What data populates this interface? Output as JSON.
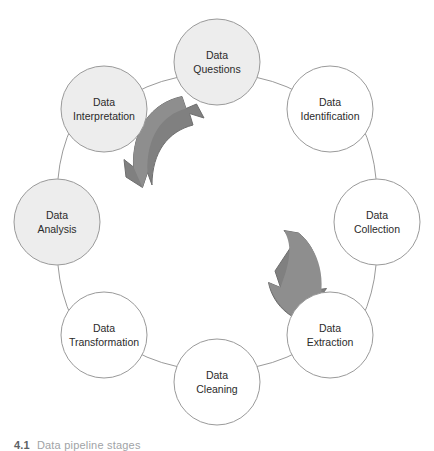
{
  "figure": {
    "type": "cycle-diagram",
    "geometry": {
      "center_x": 217,
      "center_y": 222,
      "ring_radius": 160,
      "node_radius": 43
    },
    "colors": {
      "node_fill_shaded": "#ededed",
      "node_fill_plain": "#ffffff",
      "node_stroke": "#9a9a9a",
      "arrow_fill": "#808080",
      "arrow_stroke": "#6e6e6e",
      "label_text": "#2b2b2b",
      "background": "#ffffff"
    },
    "nodes": [
      {
        "id": "data-questions",
        "line1": "Data",
        "line2": "Questions",
        "angle_deg": -90,
        "shaded": true,
        "cx": 217,
        "cy": 62
      },
      {
        "id": "data-identification",
        "line1": "Data",
        "line2": "Identification",
        "angle_deg": -45,
        "shaded": false,
        "cx": 330,
        "cy": 109
      },
      {
        "id": "data-collection",
        "line1": "Data",
        "line2": "Collection",
        "angle_deg": 0,
        "shaded": false,
        "cx": 377,
        "cy": 222
      },
      {
        "id": "data-extraction",
        "line1": "Data",
        "line2": "Extraction",
        "angle_deg": 45,
        "shaded": false,
        "cx": 330,
        "cy": 335
      },
      {
        "id": "data-cleaning",
        "line1": "Data",
        "line2": "Cleaning",
        "angle_deg": 90,
        "shaded": false,
        "cx": 217,
        "cy": 382
      },
      {
        "id": "data-transformation",
        "line1": "Data",
        "line2": "Transformation",
        "angle_deg": 135,
        "shaded": false,
        "cx": 104,
        "cy": 335
      },
      {
        "id": "data-analysis",
        "line1": "Data",
        "line2": "Analysis",
        "angle_deg": 180,
        "shaded": true,
        "cx": 57,
        "cy": 222
      },
      {
        "id": "data-interpretation",
        "line1": "Data",
        "line2": "Interpretation",
        "angle_deg": -135,
        "shaded": true,
        "cx": 104,
        "cy": 109
      }
    ],
    "arrows": [
      {
        "id": "arrow-upper-left",
        "direction": "clockwise-up-right",
        "description": "curved arrow pointing up and to the right"
      },
      {
        "id": "arrow-lower-right",
        "direction": "clockwise-down-left",
        "description": "curved arrow pointing down and to the left"
      }
    ]
  },
  "caption": {
    "number": "4.1",
    "text": "Data pipeline stages"
  }
}
